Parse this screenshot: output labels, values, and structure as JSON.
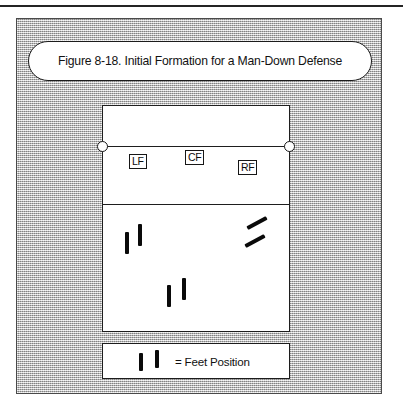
{
  "figure": {
    "caption": "Figure 8-18. Initial Formation for a Man-Down Defense",
    "page_rule": true
  },
  "colors": {
    "ink": "#1a1a1a",
    "panel_gray": "#c9c9c9",
    "court_fill": "#ffffff",
    "foot_mark": "#0a0a0a"
  },
  "court": {
    "name": "volleyball-court",
    "lines": [
      {
        "name": "net-line",
        "label": "Net",
        "y": 40
      },
      {
        "name": "attack-line",
        "label": "Attack Line",
        "y": 98
      }
    ],
    "net_posts": [
      {
        "name": "net-post-left",
        "side": "left"
      },
      {
        "name": "net-post-right",
        "side": "right"
      }
    ],
    "players": [
      {
        "id": "LF",
        "label": "LF",
        "name": "player-token-lf",
        "x": 26,
        "y": 48
      },
      {
        "id": "CF",
        "label": "CF",
        "name": "player-token-cf",
        "x": 82,
        "y": 44
      },
      {
        "id": "RF",
        "label": "RF",
        "name": "player-token-rf",
        "x": 135,
        "y": 54
      }
    ],
    "feet": [
      {
        "name": "foot-left-back-a",
        "x": 22,
        "y": 126,
        "h": 22,
        "rot": 0
      },
      {
        "name": "foot-left-back-b",
        "x": 35,
        "y": 118,
        "h": 22,
        "rot": 0
      },
      {
        "name": "foot-center-back-a",
        "x": 64,
        "y": 179,
        "h": 22,
        "rot": 0
      },
      {
        "name": "foot-center-back-b",
        "x": 79,
        "y": 172,
        "h": 22,
        "rot": 0
      },
      {
        "name": "foot-right-back-a",
        "x": 152,
        "y": 106,
        "h": 22,
        "rot": 62
      },
      {
        "name": "foot-right-back-b",
        "x": 150,
        "y": 124,
        "h": 22,
        "rot": 62
      }
    ]
  },
  "legend": {
    "name": "legend-feet-position",
    "text": "= Feet Position",
    "marks": [
      {
        "name": "legend-foot-a",
        "x": 36,
        "y": 9,
        "h": 18,
        "rot": 0
      },
      {
        "name": "legend-foot-b",
        "x": 52,
        "y": 6,
        "h": 18,
        "rot": 0
      }
    ]
  }
}
